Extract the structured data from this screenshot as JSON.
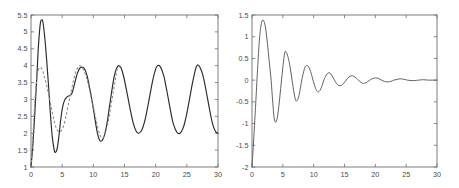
{
  "figure": {
    "title": "",
    "panels": [
      "left-panel",
      "right-panel"
    ],
    "background_color": "#ffffff",
    "axis_color": "#6f6f6f",
    "solid_curve_color": "#2a2a2a",
    "dashed_curve_color": "#8a8a8a"
  },
  "chart_data": [
    {
      "type": "line",
      "id": "left-panel",
      "title": "",
      "xlabel": "",
      "ylabel": "",
      "xlim": [
        0,
        30
      ],
      "ylim": [
        1,
        5.5
      ],
      "xticks": [
        0,
        5,
        10,
        15,
        20,
        25,
        30
      ],
      "xtick_labels": [
        "0",
        "5",
        "10",
        "15",
        "20",
        "25",
        "30"
      ],
      "yticks": [
        1,
        1.5,
        2,
        2.5,
        3,
        3.5,
        4,
        4.5,
        5,
        5.5
      ],
      "ytick_labels": [
        "1",
        "1.5",
        "2",
        "2.5",
        "3",
        "3.5",
        "4",
        "4.5",
        "5",
        "5.5"
      ],
      "grid": false,
      "legend": "none",
      "series": [
        {
          "name": "solid-curve",
          "style": "solid",
          "color": "#2a2a2a",
          "x": [
            0,
            0.3,
            0.6,
            0.9,
            1.2,
            1.5,
            1.7,
            1.9,
            2.2,
            2.5,
            2.8,
            3.1,
            3.4,
            3.7,
            3.9,
            4.2,
            4.5,
            4.8,
            5.1,
            5.4,
            5.7,
            6.0,
            6.3,
            6.6,
            6.9,
            7.2,
            7.5,
            7.8,
            8.1,
            8.35,
            8.6,
            9.0,
            9.4,
            9.8,
            10.2,
            10.6,
            11.0,
            11.4,
            11.8,
            12.2,
            12.6,
            13.0,
            13.4,
            13.9,
            14.4,
            14.9,
            15.4,
            15.9,
            16.4,
            16.9,
            17.3,
            17.8,
            18.3,
            18.8,
            19.3,
            19.8,
            20.3,
            20.8,
            21.3,
            21.8,
            22.3,
            22.8,
            23.4,
            23.9,
            24.4,
            24.9,
            25.4,
            25.9,
            26.4,
            26.7,
            27.1,
            27.6,
            28.1,
            28.6,
            29.1,
            29.6,
            30
          ],
          "y": [
            1.0,
            1.65,
            2.55,
            3.55,
            4.6,
            5.25,
            5.35,
            5.3,
            4.85,
            4.2,
            3.45,
            2.6,
            1.92,
            1.52,
            1.43,
            1.55,
            1.95,
            2.45,
            2.8,
            2.98,
            3.06,
            3.1,
            3.12,
            3.2,
            3.4,
            3.62,
            3.8,
            3.92,
            3.95,
            3.95,
            3.9,
            3.7,
            3.35,
            2.95,
            2.5,
            2.05,
            1.8,
            1.78,
            1.95,
            2.3,
            2.8,
            3.3,
            3.72,
            3.98,
            3.95,
            3.65,
            3.2,
            2.72,
            2.3,
            2.05,
            2.0,
            2.1,
            2.4,
            2.85,
            3.35,
            3.78,
            4.0,
            3.95,
            3.7,
            3.25,
            2.75,
            2.3,
            2.03,
            2.0,
            2.15,
            2.5,
            2.98,
            3.48,
            3.9,
            4.02,
            3.95,
            3.7,
            3.25,
            2.75,
            2.3,
            2.05,
            2.0
          ]
        },
        {
          "name": "dashed-curve",
          "style": "dashed",
          "color": "#8a8a8a",
          "x": [
            0,
            0.3,
            0.6,
            0.9,
            1.2,
            1.5,
            1.8,
            2.1,
            2.4,
            2.8,
            3.2,
            3.6,
            4.0,
            4.4,
            4.8,
            5.2,
            5.6,
            6.0,
            6.4,
            6.8,
            7.2,
            7.6,
            7.9,
            8.2,
            8.6,
            9.0,
            9.5,
            10.0,
            10.5,
            11.0,
            11.5,
            12.0,
            12.5,
            13.0,
            13.5,
            13.9,
            14.4
          ],
          "y": [
            1.0,
            1.9,
            2.9,
            3.55,
            3.88,
            3.95,
            3.88,
            3.7,
            3.5,
            3.18,
            2.82,
            2.45,
            2.18,
            2.05,
            2.06,
            2.2,
            2.5,
            2.85,
            3.2,
            3.55,
            3.82,
            3.97,
            4.0,
            3.95,
            3.8,
            3.58,
            3.2,
            2.78,
            2.35,
            1.98,
            1.85,
            2.05,
            2.45,
            3.0,
            3.55,
            3.95,
            3.94
          ]
        }
      ]
    },
    {
      "type": "line",
      "id": "right-panel",
      "title": "",
      "xlabel": "",
      "ylabel": "",
      "xlim": [
        0,
        30
      ],
      "ylim": [
        -2,
        1.5
      ],
      "xticks": [
        0,
        5,
        10,
        15,
        20,
        25,
        30
      ],
      "xtick_labels": [
        "0",
        "5",
        "10",
        "15",
        "20",
        "25",
        "30"
      ],
      "yticks": [
        -2,
        -1.5,
        -1,
        -0.5,
        0,
        0.5,
        1,
        1.5
      ],
      "ytick_labels": [
        "-2",
        "-1.5",
        "-1",
        "-0.5",
        "0",
        "0.5",
        "1",
        "1.5"
      ],
      "grid": false,
      "legend": "none",
      "series": [
        {
          "name": "damped-oscillation",
          "style": "solid",
          "color": "#5a5a5a",
          "x": [
            0,
            0.2,
            0.4,
            0.6,
            0.9,
            1.2,
            1.45,
            1.7,
            1.95,
            2.2,
            2.5,
            2.8,
            3.1,
            3.35,
            3.6,
            3.9,
            4.2,
            4.5,
            4.8,
            5.1,
            5.35,
            5.6,
            5.9,
            6.2,
            6.5,
            6.8,
            7.1,
            7.4,
            7.7,
            8.0,
            8.3,
            8.6,
            8.9,
            9.2,
            9.5,
            9.8,
            10.1,
            10.4,
            10.7,
            11.0,
            11.3,
            11.6,
            11.9,
            12.2,
            12.5,
            12.8,
            13.1,
            13.5,
            13.9,
            14.3,
            14.7,
            15.1,
            15.5,
            15.9,
            16.3,
            16.7,
            17.1,
            17.5,
            17.9,
            18.3,
            18.7,
            19.1,
            19.6,
            20.0,
            20.5,
            21.0,
            21.5,
            22.0,
            22.5,
            23.0,
            23.6,
            24.1,
            24.6,
            25.2,
            25.8,
            26.4,
            27.0,
            27.8,
            28.6,
            29.3,
            30
          ],
          "y": [
            -2.0,
            -1.55,
            -1.05,
            -0.55,
            0.25,
            0.92,
            1.25,
            1.38,
            1.35,
            1.2,
            0.85,
            0.42,
            0.0,
            -0.48,
            -0.88,
            -0.96,
            -0.78,
            -0.4,
            0.02,
            0.42,
            0.65,
            0.63,
            0.5,
            0.28,
            0.0,
            -0.28,
            -0.47,
            -0.45,
            -0.3,
            -0.05,
            0.15,
            0.3,
            0.34,
            0.3,
            0.2,
            0.05,
            -0.1,
            -0.22,
            -0.27,
            -0.24,
            -0.15,
            -0.02,
            0.08,
            0.15,
            0.17,
            0.14,
            0.07,
            -0.03,
            -0.11,
            -0.13,
            -0.1,
            -0.03,
            0.04,
            0.09,
            0.1,
            0.07,
            0.02,
            -0.03,
            -0.07,
            -0.07,
            -0.04,
            0.0,
            0.04,
            0.05,
            0.04,
            0.0,
            -0.03,
            -0.04,
            -0.03,
            0.0,
            0.02,
            0.03,
            0.02,
            0.0,
            -0.01,
            -0.01,
            0.0,
            0.01,
            0.0,
            0.0,
            0.0
          ]
        }
      ]
    }
  ]
}
